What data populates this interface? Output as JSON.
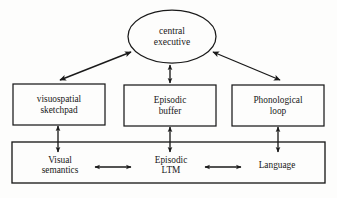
{
  "figure": {
    "background_color": "#fdfdfc",
    "stroke_color": "#1a1a1a"
  },
  "nodes": {
    "central_executive": {
      "shape": "ellipse",
      "line1": "central",
      "line2": "executive"
    },
    "visuospatial_sketchpad": {
      "shape": "rectangle",
      "line1": "visuospatial",
      "line2": "sketchpad"
    },
    "episodic_buffer": {
      "shape": "rectangle",
      "line1": "Episodic",
      "line2": "buffer"
    },
    "phonological_loop": {
      "shape": "rectangle",
      "line1": "Phonological",
      "line2": "loop"
    },
    "visual_semantics": {
      "shape": "text",
      "line1": "Visual",
      "line2": "semantics"
    },
    "episodic_ltm": {
      "shape": "text",
      "line1": "Episodic",
      "line2": "LTM"
    },
    "language": {
      "shape": "text",
      "line1": "Language",
      "line2": ""
    }
  },
  "connectors": [
    {
      "name": "central-executive-to-visuospatial-sketchpad",
      "style": "double-headed-diagonal"
    },
    {
      "name": "central-executive-to-episodic-buffer",
      "style": "double-headed-vertical"
    },
    {
      "name": "central-executive-to-phonological-loop",
      "style": "double-headed-diagonal"
    },
    {
      "name": "visuospatial-sketchpad-to-visual-semantics",
      "style": "double-headed-vertical"
    },
    {
      "name": "episodic-buffer-to-episodic-ltm",
      "style": "double-headed-vertical"
    },
    {
      "name": "phonological-loop-to-language",
      "style": "double-headed-vertical"
    },
    {
      "name": "visual-semantics-to-episodic-ltm",
      "style": "double-headed-horizontal"
    },
    {
      "name": "episodic-ltm-to-language",
      "style": "double-headed-horizontal"
    }
  ]
}
